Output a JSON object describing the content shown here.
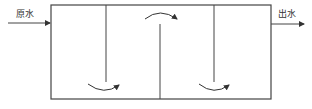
{
  "diagram": {
    "type": "baffled-tank-flow",
    "inlet_label": "原水",
    "outlet_label": "出水",
    "stroke_color": "#444444",
    "baffles": [
      {
        "position": "x1",
        "attached": "top",
        "flow": "down-under"
      },
      {
        "position": "x2",
        "attached": "bottom",
        "flow": "up-over"
      },
      {
        "position": "x3",
        "attached": "top",
        "flow": "down-under"
      }
    ]
  }
}
